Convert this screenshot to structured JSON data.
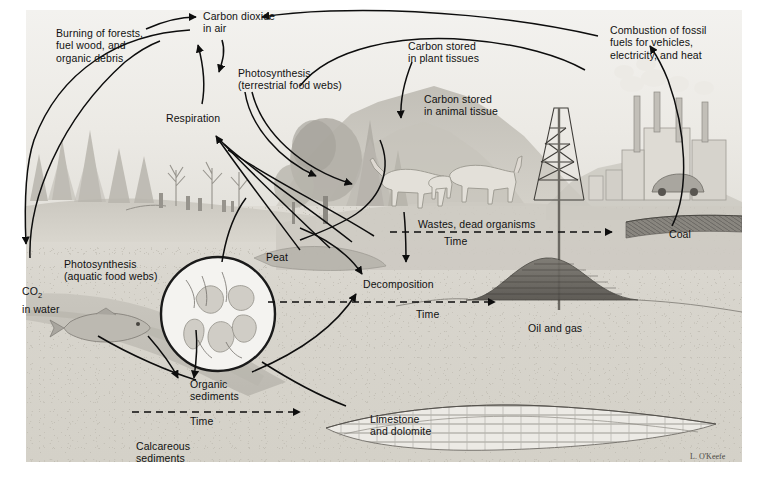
{
  "figure": {
    "credit": "L. O'Keefe",
    "width": 759,
    "height": 480,
    "palette": {
      "ink": "#111111",
      "paper": "#ffffff",
      "sky": "#eceae5",
      "soil": "#d8d5cd",
      "water": "#e0ded8",
      "hill": "#cfccc4"
    }
  },
  "labels": {
    "burning": "Burning of forests,\nfuel wood, and\norganic debris",
    "co2_air": "Carbon dioxide\nin air",
    "combustion": "Combustion of fossil\nfuels for vehicles,\nelectricity, and heat",
    "photo_terrestrial": "Photosynthesis\n(terrestrial food webs)",
    "respiration": "Respiration",
    "carbon_plant": "Carbon stored\nin plant tissues",
    "carbon_animal": "Carbon stored\nin animal tissue",
    "wastes": "Wastes, dead organisms",
    "time_wastes": "Time",
    "coal": "Coal",
    "peat": "Peat",
    "decomposition": "Decomposition",
    "time_oil": "Time",
    "oil_and_gas": "Oil and gas",
    "photo_aquatic": "Photosynthesis\n(aquatic food webs)",
    "co2_water_line1": "CO",
    "co2_water_sub": "2",
    "co2_water_line2": "in water",
    "organic_sediments": "Organic\nsediments",
    "time_sediments": "Time",
    "calcareous_sediments": "Calcareous\nsediments",
    "limestone": "Limestone\nand dolomite"
  },
  "scene_elements": {
    "conifer_forest": "conifer-forest",
    "dead_trees": "dead-trees",
    "broadleaf_tree": "broadleaf-tree",
    "mountain_range": "mountain-range",
    "grazing_animals": "grazing-animals",
    "oil_derrick": "oil-derrick",
    "factory_smokestacks": "factory-smokestacks",
    "automobile": "automobile",
    "coal_seam": "coal-seam",
    "oil_reservoir": "oil-reservoir",
    "limestone_layer": "limestone-layer",
    "fish": "fish",
    "magnifier_plankton": "magnifier-plankton-inset",
    "lake_water": "lake-water",
    "sediment_slope": "sediment-slope"
  },
  "arrows": [
    {
      "name": "burning-to-co2",
      "from": "burning",
      "to": "co2_air"
    },
    {
      "name": "combustion-to-co2",
      "from": "combustion",
      "to": "co2_air"
    },
    {
      "name": "co2-to-photosynthesis-terrestrial",
      "from": "co2_air",
      "to": "photo_terrestrial"
    },
    {
      "name": "photosynthesis-to-plants",
      "from": "photo_terrestrial",
      "to": "plants"
    },
    {
      "name": "respiration-to-co2",
      "from": "respiration",
      "to": "co2_air"
    },
    {
      "name": "biota-to-respiration",
      "from": "biota",
      "to": "respiration"
    },
    {
      "name": "plant-to-animal-tissue",
      "from": "carbon_plant",
      "to": "carbon_animal"
    },
    {
      "name": "animals-to-wastes",
      "from": "animals",
      "to": "wastes"
    },
    {
      "name": "wastes-to-coal",
      "from": "wastes",
      "to": "coal"
    },
    {
      "name": "coal-to-combustion",
      "from": "coal",
      "to": "combustion"
    },
    {
      "name": "biota-to-decomposition",
      "from": "biota",
      "to": "decomposition"
    },
    {
      "name": "decomposition-to-oil-gas",
      "from": "decomposition",
      "to": "oil_and_gas"
    },
    {
      "name": "co2-air-to-co2-water",
      "from": "co2_air",
      "to": "co2_water"
    },
    {
      "name": "aquatic-photosynthesis-to-organic-sediments",
      "from": "photo_aquatic",
      "to": "organic_sediments"
    },
    {
      "name": "organic-sediments-to-decomposition",
      "from": "organic_sediments",
      "to": "decomposition"
    },
    {
      "name": "calcareous-sediments-to-limestone",
      "from": "calcareous_sediments",
      "to": "limestone"
    },
    {
      "name": "forest-to-burning",
      "from": "forest",
      "to": "burning"
    }
  ]
}
